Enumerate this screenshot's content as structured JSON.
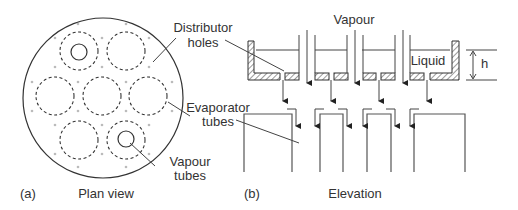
{
  "figure": {
    "plan_view": {
      "panel_label": "(a)",
      "caption": "Plan view",
      "labels": {
        "distributor_holes": [
          "Distributor",
          "holes"
        ],
        "evaporator_tubes": [
          "Evaporator",
          "tubes"
        ],
        "vapour_tubes": [
          "Vapour",
          "tubes"
        ]
      },
      "evaporator_tube_count": 7,
      "vapour_tube_count": 2
    },
    "elevation": {
      "panel_label": "(b)",
      "caption": "Elevation",
      "labels": {
        "vapour": "Vapour",
        "liquid": "Liquid",
        "height": "h"
      }
    }
  }
}
